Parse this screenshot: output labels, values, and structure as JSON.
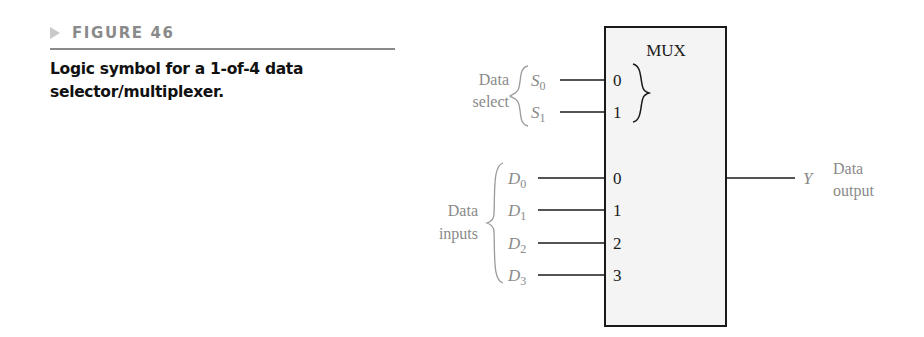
{
  "figure": {
    "label": "FIGURE 46",
    "caption_line1": "Logic symbol for a 1-of-4 data",
    "caption_line2": "selector/multiplexer."
  },
  "mux": {
    "title": "MUX",
    "select_group_label_line1": "Data",
    "select_group_label_line2": "select",
    "select_inputs": [
      {
        "name": "S",
        "sub": "0",
        "pin": "0"
      },
      {
        "name": "S",
        "sub": "1",
        "pin": "1"
      }
    ],
    "data_group_label_line1": "Data",
    "data_group_label_line2": "inputs",
    "data_inputs": [
      {
        "name": "D",
        "sub": "0",
        "pin": "0"
      },
      {
        "name": "D",
        "sub": "1",
        "pin": "1"
      },
      {
        "name": "D",
        "sub": "2",
        "pin": "2"
      },
      {
        "name": "D",
        "sub": "3",
        "pin": "3"
      }
    ],
    "output": {
      "name": "Y",
      "label_line1": "Data",
      "label_line2": "output"
    }
  },
  "colors": {
    "box_fill": "#f4f4f4",
    "line": "#1a1a1a",
    "label_gray": "#8a8a8a"
  }
}
